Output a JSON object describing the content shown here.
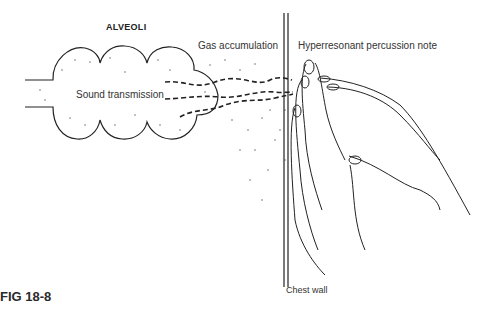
{
  "figure": {
    "label": "FIG 18-8",
    "title": "ALVEOLI",
    "labels": {
      "sound": "Sound transmission",
      "gas": "Gas accumulation",
      "percussion": "Hyperresonant percussion note",
      "chest": "Chest wall"
    }
  }
}
